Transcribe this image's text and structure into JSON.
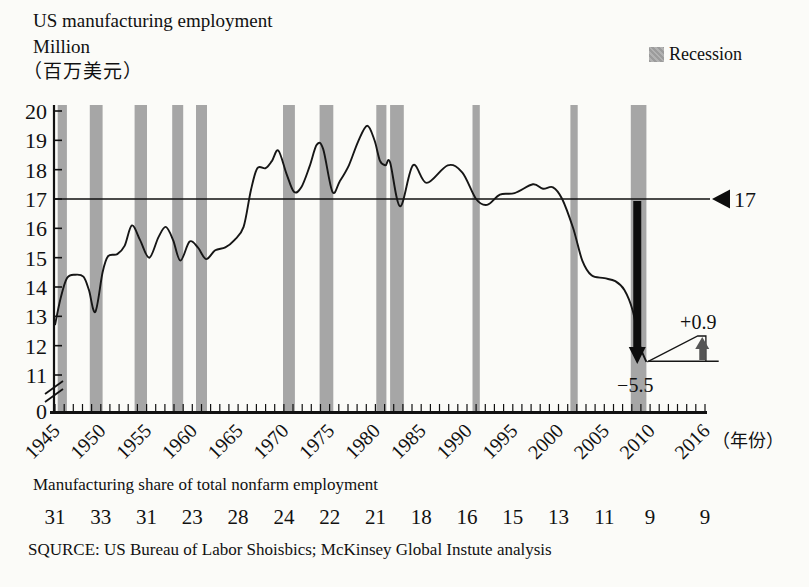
{
  "header": {
    "title_line1": "US manufacturing employment",
    "title_line2": "Million",
    "title_line3": "（百万美元）",
    "legend_label": "Recession"
  },
  "chart_data": {
    "type": "line",
    "ylabel": "Million",
    "xlabel": "（年份）",
    "ylim": [
      11,
      20
    ],
    "xlim": [
      1945,
      2016
    ],
    "grid": false,
    "legend_position": "top-right",
    "y_ticks": [
      11,
      12,
      13,
      14,
      15,
      16,
      17,
      18,
      19,
      20
    ],
    "y_origin_label": "0",
    "x_tick_years": [
      1945,
      1950,
      1955,
      1960,
      1965,
      1970,
      1975,
      1980,
      1985,
      1990,
      1995,
      2000,
      2005,
      2010,
      2016
    ],
    "x_axis_suffix": "（年份）",
    "reference_line": {
      "value": 17,
      "label": "17"
    },
    "series": [
      {
        "name": "US manufacturing employment (million)",
        "points": [
          [
            1945,
            12.7
          ],
          [
            1945.6,
            13.6
          ],
          [
            1946.3,
            14.3
          ],
          [
            1947.2,
            14.42
          ],
          [
            1948.1,
            14.35
          ],
          [
            1948.7,
            13.9
          ],
          [
            1949.4,
            13.15
          ],
          [
            1950.2,
            14.5
          ],
          [
            1950.8,
            15.05
          ],
          [
            1951.8,
            15.12
          ],
          [
            1952.6,
            15.4
          ],
          [
            1953.4,
            16.1
          ],
          [
            1954.3,
            15.6
          ],
          [
            1955.3,
            15.0
          ],
          [
            1956.3,
            15.7
          ],
          [
            1957.1,
            16.05
          ],
          [
            1957.9,
            15.6
          ],
          [
            1958.7,
            14.9
          ],
          [
            1959.7,
            15.55
          ],
          [
            1960.6,
            15.35
          ],
          [
            1961.5,
            14.95
          ],
          [
            1962.5,
            15.25
          ],
          [
            1963.6,
            15.35
          ],
          [
            1964.6,
            15.6
          ],
          [
            1965.6,
            16.05
          ],
          [
            1966.4,
            17.3
          ],
          [
            1967.1,
            18.05
          ],
          [
            1968,
            18.05
          ],
          [
            1968.7,
            18.3
          ],
          [
            1969.4,
            18.65
          ],
          [
            1970.3,
            17.85
          ],
          [
            1971.1,
            17.25
          ],
          [
            1971.9,
            17.4
          ],
          [
            1972.8,
            18.1
          ],
          [
            1973.6,
            18.85
          ],
          [
            1974.3,
            18.7
          ],
          [
            1975.3,
            17.25
          ],
          [
            1976.1,
            17.6
          ],
          [
            1977.1,
            18.15
          ],
          [
            1978.1,
            18.95
          ],
          [
            1979.1,
            19.5
          ],
          [
            1979.9,
            19.0
          ],
          [
            1980.5,
            18.3
          ],
          [
            1981.1,
            18.15
          ],
          [
            1981.6,
            18.25
          ],
          [
            1982.7,
            16.75
          ],
          [
            1984.1,
            18.15
          ],
          [
            1985.6,
            17.55
          ],
          [
            1987.9,
            18.15
          ],
          [
            1989.5,
            17.9
          ],
          [
            1991,
            17.0
          ],
          [
            1992.2,
            16.8
          ],
          [
            1993.6,
            17.15
          ],
          [
            1995.2,
            17.2
          ],
          [
            1997.2,
            17.5
          ],
          [
            1998.3,
            17.35
          ],
          [
            1999.4,
            17.4
          ],
          [
            2000.4,
            17.0
          ],
          [
            2001.6,
            16.0
          ],
          [
            2002.6,
            14.9
          ],
          [
            2003.6,
            14.4
          ],
          [
            2005,
            14.3
          ],
          [
            2006.2,
            14.2
          ],
          [
            2007.2,
            13.9
          ],
          [
            2008.1,
            13.2
          ],
          [
            2008.9,
            12.0
          ],
          [
            2009.6,
            11.45
          ]
        ]
      }
    ],
    "recession_bands": [
      [
        1945.3,
        1946.3
      ],
      [
        1948.8,
        1950.2
      ],
      [
        1953.7,
        1955.05
      ],
      [
        1957.8,
        1959.0
      ],
      [
        1960.4,
        1961.6
      ],
      [
        1969.9,
        1971.2
      ],
      [
        1973.9,
        1975.4
      ],
      [
        1980.1,
        1981.2
      ],
      [
        1981.6,
        1983.1
      ],
      [
        1990.6,
        1991.4
      ],
      [
        2001.3,
        2002.1
      ],
      [
        2007.9,
        2009.6
      ]
    ],
    "recovery_line": {
      "points": [
        [
          2009.7,
          11.45
        ],
        [
          2015.2,
          12.33
        ],
        [
          2016.1,
          12.33
        ],
        [
          2016.1,
          11.47
        ]
      ],
      "baseline": [
        [
          2009.8,
          11.47
        ],
        [
          2017.5,
          11.47
        ]
      ]
    },
    "annotations": {
      "drop": {
        "label": "−5.5",
        "x": 2008.6,
        "from": 17,
        "to": 11.6
      },
      "gain": {
        "label": "+0.9",
        "x": 2015.7,
        "from": 11.5,
        "to": 12.3
      }
    },
    "colors": {
      "recession_fill": "#a6a6a6",
      "line": "#161616",
      "axis": "#111111",
      "drop_arrow": "#0d0d0d",
      "gain_arrow": "#555555"
    }
  },
  "share_table": {
    "title": "Manufacturing share of total nonfarm employment",
    "years": [
      1945,
      1950,
      1955,
      1960,
      1965,
      1970,
      1975,
      1980,
      1985,
      1990,
      1995,
      2000,
      2005,
      2010,
      2016
    ],
    "values": [
      "31",
      "33",
      "31",
      "23",
      "28",
      "24",
      "22",
      "21",
      "18",
      "16",
      "15",
      "13",
      "11",
      "9",
      "9"
    ]
  },
  "source": "SQURCE: US Bureau of Labor Shoisbics; McKinsey Global Instute analysis"
}
